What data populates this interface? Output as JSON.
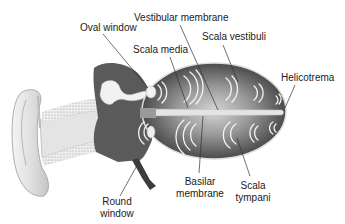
{
  "diagram": {
    "labels": {
      "oval_window": "Oval window",
      "vestibular_membrane": "Vestibular membrane",
      "scala_vestibuli": "Scala vestibuli",
      "scala_media": "Scala media",
      "helicotrema": "Helicotrema",
      "basilar_membrane_line1": "Basilar",
      "basilar_membrane_line2": "membrane",
      "scala_tympani_line1": "Scala",
      "scala_tympani_line2": "tympani",
      "round_window_line1": "Round",
      "round_window_line2": "window"
    },
    "icons": {
      "sound_wave": "sound-wave-arcs"
    },
    "colors": {
      "cochlea_dark": "#4a4a4a",
      "cochlea_light": "#c8c8c8",
      "middle_ear": "#5a5a5a",
      "ear_skin": "#e8e8e8",
      "leader_line": "#333333",
      "text": "#222222"
    }
  }
}
